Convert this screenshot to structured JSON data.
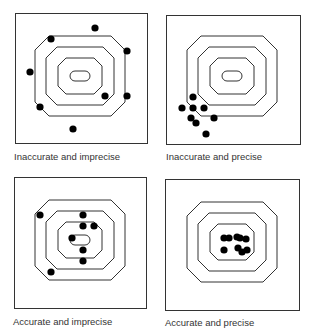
{
  "figure": {
    "panels": [
      {
        "id": "inaccurate-imprecise",
        "caption": "Inaccurate and imprecise",
        "box": {
          "x": 15,
          "y": 13,
          "w": 132,
          "h": 130
        },
        "center": {
          "x": 80,
          "y": 76
        },
        "rings": 4,
        "shots": [
          [
            95,
            28
          ],
          [
            51,
            39
          ],
          [
            127,
            51
          ],
          [
            30,
            72
          ],
          [
            105,
            96
          ],
          [
            127,
            96
          ],
          [
            40,
            107
          ],
          [
            73,
            129
          ]
        ]
      },
      {
        "id": "inaccurate-precise",
        "caption": "Inaccurate and precise",
        "box": {
          "x": 166,
          "y": 15,
          "w": 134,
          "h": 129
        },
        "center": {
          "x": 232,
          "y": 76
        },
        "rings": 4,
        "shots": [
          [
            193,
            97
          ],
          [
            182,
            108
          ],
          [
            193,
            108
          ],
          [
            204,
            108
          ],
          [
            191,
            118
          ],
          [
            196,
            123
          ],
          [
            214,
            118
          ],
          [
            206,
            134
          ]
        ]
      },
      {
        "id": "accurate-imprecise",
        "caption": "Accurate and imprecise",
        "box": {
          "x": 14,
          "y": 177,
          "w": 132,
          "h": 131
        },
        "center": {
          "x": 80,
          "y": 240
        },
        "rings": 4,
        "shots": [
          [
            40,
            215
          ],
          [
            83,
            215
          ],
          [
            83,
            226
          ],
          [
            94,
            226
          ],
          [
            72,
            238
          ],
          [
            83,
            250
          ],
          [
            83,
            261
          ],
          [
            51,
            272
          ]
        ]
      },
      {
        "id": "accurate-precise",
        "caption": "Accurate and precise",
        "box": {
          "x": 165,
          "y": 179,
          "w": 134,
          "h": 131
        },
        "center": {
          "x": 232,
          "y": 242
        },
        "rings": 3,
        "shots": [
          [
            224,
            238
          ],
          [
            229,
            238
          ],
          [
            237,
            237
          ],
          [
            240,
            238
          ],
          [
            246,
            239
          ],
          [
            224,
            250
          ],
          [
            238,
            248
          ],
          [
            242,
            252
          ],
          [
            247,
            250
          ]
        ]
      }
    ],
    "dot_color": "#000000",
    "line_color": "#333333"
  }
}
